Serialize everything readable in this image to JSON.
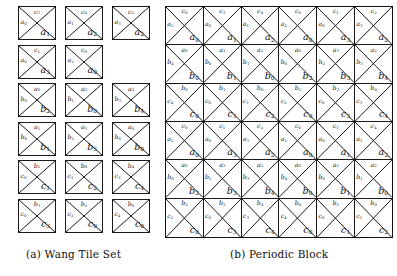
{
  "figure": {
    "panels": [
      {
        "id": "tileset",
        "caption": "(a) Wang Tile Set"
      },
      {
        "id": "block",
        "caption": "(b) Periodic Block"
      }
    ],
    "colors": {
      "stroke": "#1a1a1a",
      "background": "#ffffff",
      "text": "#111111"
    },
    "notation": {
      "edge_order": "north, west, south",
      "label_families": [
        "a",
        "b",
        "c"
      ]
    }
  },
  "tile_set": {
    "caption": "(a) Wang Tile Set",
    "columns": 3,
    "rows": 6,
    "tiles": [
      {
        "row": 1,
        "col": 1,
        "north": "c3",
        "west": "a0",
        "south": "a1"
      },
      {
        "row": 1,
        "col": 2,
        "north": "c4",
        "west": "a1",
        "south": "a2"
      },
      {
        "row": 1,
        "col": 3,
        "north": "c2",
        "west": "a3",
        "south": "a2"
      },
      {
        "row": 2,
        "col": 1,
        "north": "c1",
        "west": "a0",
        "south": "a3"
      },
      {
        "row": 2,
        "col": 2,
        "north": "c0",
        "west": "a2",
        "south": "a0"
      },
      {
        "row": 3,
        "col": 1,
        "north": "a0",
        "west": "b0",
        "south": "b2"
      },
      {
        "row": 3,
        "col": 2,
        "north": "a2",
        "west": "b1",
        "south": "b0"
      },
      {
        "row": 3,
        "col": 3,
        "north": "a2",
        "west": "b3",
        "south": "b4"
      },
      {
        "row": 4,
        "col": 1,
        "north": "a1",
        "west": "b0",
        "south": "b1"
      },
      {
        "row": 4,
        "col": 2,
        "north": "a3",
        "west": "b2",
        "south": "b3"
      },
      {
        "row": 4,
        "col": 3,
        "north": "a0",
        "west": "b4",
        "south": "b0"
      },
      {
        "row": 5,
        "col": 1,
        "north": "b1",
        "west": "c0",
        "south": "c1"
      },
      {
        "row": 5,
        "col": 2,
        "north": "b0",
        "west": "c1",
        "south": "c2"
      },
      {
        "row": 5,
        "col": 3,
        "north": "b4",
        "west": "c3",
        "south": "c4"
      },
      {
        "row": 6,
        "col": 1,
        "north": "b3",
        "west": "c0",
        "south": "c3"
      },
      {
        "row": 6,
        "col": 2,
        "north": "b2",
        "west": "c2",
        "south": "c0"
      },
      {
        "row": 6,
        "col": 3,
        "north": "b0",
        "west": "c4",
        "south": "c0"
      }
    ]
  },
  "periodic_block": {
    "caption": "(b) Periodic Block",
    "columns": 6,
    "rows": 6,
    "grid": [
      [
        {
          "north": "c0",
          "west": "a2",
          "south": "a0"
        },
        {
          "north": "c3",
          "west": "a0",
          "south": "a1"
        },
        {
          "north": "c4",
          "west": "a1",
          "south": "a2"
        },
        {
          "north": "c0",
          "west": "a2",
          "south": "a0"
        },
        {
          "north": "c1",
          "west": "a0",
          "south": "a3"
        },
        {
          "north": "c2",
          "west": "a3",
          "south": "a2"
        }
      ],
      [
        {
          "north": "a0",
          "west": "b4",
          "south": "b0"
        },
        {
          "north": "a1",
          "west": "b0",
          "south": "b1"
        },
        {
          "north": "a2",
          "west": "b1",
          "south": "b0"
        },
        {
          "north": "a0",
          "west": "b0",
          "south": "b2"
        },
        {
          "north": "a3",
          "west": "b2",
          "south": "b3"
        },
        {
          "north": "a2",
          "west": "b3",
          "south": "b4"
        }
      ],
      [
        {
          "north": "b0",
          "west": "c4",
          "south": "c0"
        },
        {
          "north": "b1",
          "west": "c0",
          "south": "c1"
        },
        {
          "north": "b0",
          "west": "c1",
          "south": "c2"
        },
        {
          "north": "b2",
          "west": "c2",
          "south": "c0"
        },
        {
          "north": "b3",
          "west": "c0",
          "south": "c3"
        },
        {
          "north": "b4",
          "west": "c3",
          "south": "c4"
        }
      ],
      [
        {
          "north": "c0",
          "west": "a2",
          "south": "a0"
        },
        {
          "north": "c1",
          "west": "a0",
          "south": "a3"
        },
        {
          "north": "c2",
          "west": "a3",
          "south": "a2"
        },
        {
          "north": "c0",
          "west": "a2",
          "south": "a0"
        },
        {
          "north": "c3",
          "west": "a0",
          "south": "a1"
        },
        {
          "north": "c4",
          "west": "a1",
          "south": "a2"
        }
      ],
      [
        {
          "north": "a0",
          "west": "b0",
          "south": "b2"
        },
        {
          "north": "a3",
          "west": "b2",
          "south": "b3"
        },
        {
          "north": "a2",
          "west": "b3",
          "south": "b4"
        },
        {
          "north": "a0",
          "west": "b4",
          "south": "b0"
        },
        {
          "north": "a1",
          "west": "b0",
          "south": "b1"
        },
        {
          "north": "a2",
          "west": "b1",
          "south": "b0"
        }
      ],
      [
        {
          "north": "b2",
          "west": "c2",
          "south": "c0"
        },
        {
          "north": "b3",
          "west": "c0",
          "south": "c3"
        },
        {
          "north": "b4",
          "west": "c3",
          "south": "c4"
        },
        {
          "north": "b0",
          "west": "c4",
          "south": "c0"
        },
        {
          "north": "b1",
          "west": "c0",
          "south": "c1"
        },
        {
          "north": "b0",
          "west": "c1",
          "south": "c2"
        }
      ]
    ]
  }
}
